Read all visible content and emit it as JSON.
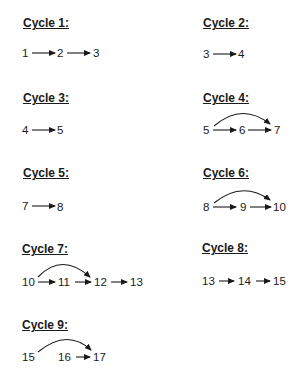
{
  "cycles": [
    {
      "title": "Cycle 1:",
      "nodes": [
        "1",
        "2",
        "3"
      ],
      "edges": [
        [
          "1",
          "2"
        ],
        [
          "2",
          "3"
        ]
      ]
    },
    {
      "title": "Cycle 2:",
      "nodes": [
        "3",
        "4"
      ],
      "edges": [
        [
          "3",
          "4"
        ]
      ]
    },
    {
      "title": "Cycle 3:",
      "nodes": [
        "4",
        "5"
      ],
      "edges": [
        [
          "4",
          "5"
        ]
      ]
    },
    {
      "title": "Cycle 4:",
      "nodes": [
        "5",
        "6",
        "7"
      ],
      "edges": [
        [
          "5",
          "6"
        ],
        [
          "6",
          "7"
        ],
        [
          "5",
          "7"
        ]
      ]
    },
    {
      "title": "Cycle 5:",
      "nodes": [
        "7",
        "8"
      ],
      "edges": [
        [
          "7",
          "8"
        ]
      ]
    },
    {
      "title": "Cycle 6:",
      "nodes": [
        "8",
        "9",
        "10"
      ],
      "edges": [
        [
          "8",
          "9"
        ],
        [
          "9",
          "10"
        ],
        [
          "8",
          "10"
        ]
      ]
    },
    {
      "title": "Cycle 7:",
      "nodes": [
        "10",
        "11",
        "12",
        "13"
      ],
      "edges": [
        [
          "10",
          "11"
        ],
        [
          "11",
          "12"
        ],
        [
          "12",
          "13"
        ],
        [
          "10",
          "12"
        ]
      ]
    },
    {
      "title": "Cycle 8:",
      "nodes": [
        "13",
        "14",
        "15"
      ],
      "edges": [
        [
          "13",
          "14"
        ],
        [
          "14",
          "15"
        ]
      ]
    },
    {
      "title": "Cycle 9:",
      "nodes": [
        "15",
        "16",
        "17"
      ],
      "edges": [
        [
          "16",
          "17"
        ],
        [
          "15",
          "17"
        ]
      ]
    }
  ]
}
